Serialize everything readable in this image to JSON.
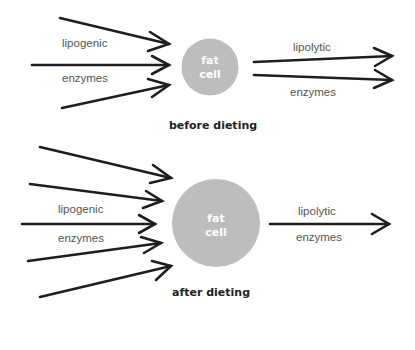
{
  "colors": {
    "cell_fill": "#bdbdbd",
    "arrow": "#1e1e1e",
    "label": "#555555",
    "caption": "#222222"
  },
  "before": {
    "caption": "before dieting",
    "cell": {
      "line1": "fat",
      "line2": "cell"
    },
    "inflow": {
      "label_top": "lipogenic",
      "label_bottom": "enzymes",
      "arrow_count": 3
    },
    "outflow": {
      "label_top": "lipolytic",
      "label_bottom": "enzymes",
      "arrow_count": 2
    }
  },
  "after": {
    "caption": "after dieting",
    "cell": {
      "line1": "fat",
      "line2": "cell"
    },
    "inflow": {
      "label_top": "lipogenic",
      "label_bottom": "enzymes",
      "arrow_count": 5
    },
    "outflow": {
      "label_top": "lipolytic",
      "label_bottom": "enzymes",
      "arrow_count": 1
    }
  }
}
